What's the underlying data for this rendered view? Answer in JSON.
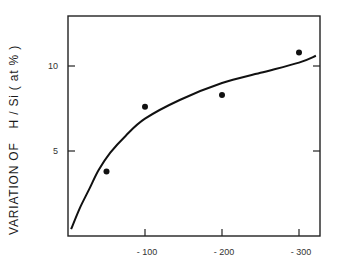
{
  "chart_data": {
    "type": "scatter",
    "title": "",
    "xlabel": "",
    "ylabel": "VARIATION OF    H / Si ( at % )",
    "ylabel_parts": [
      "VARIATION OF",
      "H / Si ( at % )"
    ],
    "xlim": [
      0,
      -330
    ],
    "ylim": [
      0,
      13
    ],
    "grid": false,
    "legend": null,
    "x_ticks": [
      {
        "value": -100,
        "label": "- 100"
      },
      {
        "value": -200,
        "label": "- 200"
      },
      {
        "value": -300,
        "label": "- 300"
      }
    ],
    "y_ticks": [
      {
        "value": 5,
        "label": "5"
      },
      {
        "value": 10,
        "label": "10"
      }
    ],
    "series": [
      {
        "name": "measured",
        "kind": "scatter",
        "x": [
          -50,
          -100,
          -200,
          -300
        ],
        "y": [
          3.8,
          7.6,
          8.3,
          10.8
        ]
      },
      {
        "name": "fit",
        "kind": "line",
        "x": [
          -4,
          -15,
          -28,
          -40,
          -55,
          -75,
          -100,
          -145,
          -200,
          -250,
          -300,
          -322
        ],
        "y": [
          0.4,
          1.6,
          2.8,
          3.9,
          4.9,
          5.9,
          6.9,
          8.0,
          9.0,
          9.6,
          10.2,
          10.6
        ]
      }
    ],
    "colors": {
      "axis": "#222222",
      "points": "#111111",
      "curve": "#111111"
    }
  }
}
